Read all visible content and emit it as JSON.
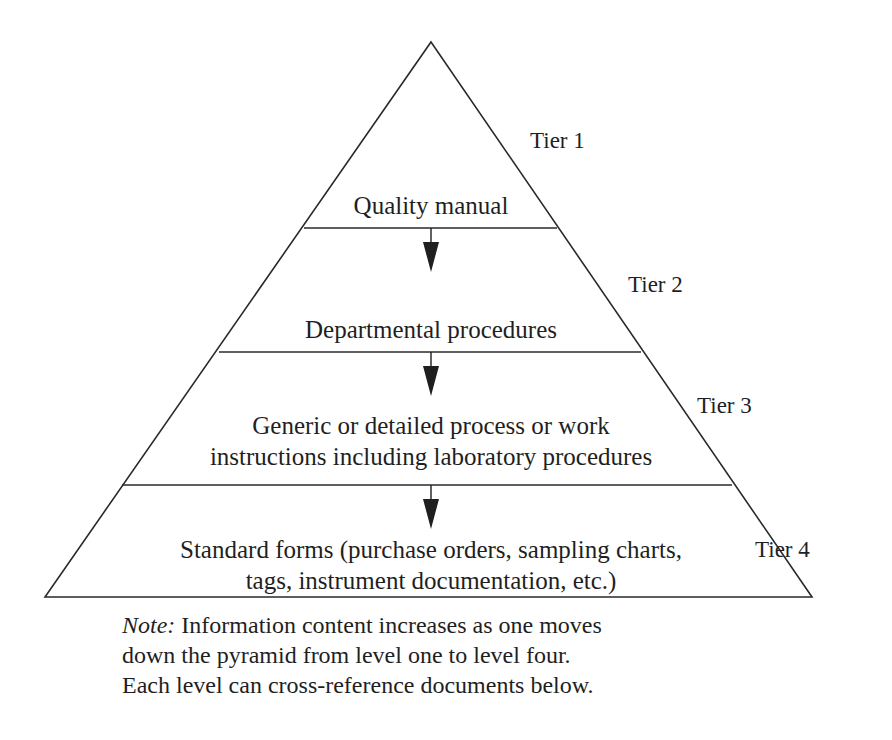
{
  "diagram": {
    "type": "pyramid",
    "tiers": [
      {
        "tier_label": "Tier 1",
        "content": "Quality manual"
      },
      {
        "tier_label": "Tier 2",
        "content": "Departmental procedures"
      },
      {
        "tier_label": "Tier 3",
        "content_line1": "Generic or detailed process or work",
        "content_line2": "instructions including laboratory procedures"
      },
      {
        "tier_label": "Tier 4",
        "content_line1": "Standard forms (purchase orders, sampling charts,",
        "content_line2": "tags, instrument documentation, etc.)"
      }
    ],
    "arrows": [
      "Tier 1 → Tier 2",
      "Tier 2 → Tier 3",
      "Tier 3 → Tier 4"
    ]
  },
  "note": {
    "prefix": "Note:",
    "line1": "Information content increases as one moves",
    "line2": "down the pyramid from level one to level four.",
    "line3": "Each level can cross-reference documents below."
  },
  "colors": {
    "line": "#2a2a2a",
    "text": "#1f1f1f",
    "background": "#ffffff"
  }
}
